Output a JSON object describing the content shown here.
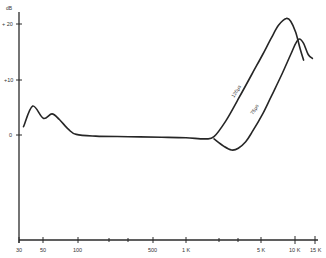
{
  "chart_data": {
    "type": "line",
    "title": "",
    "xlabel": "",
    "ylabel": "dB",
    "xscale": "log",
    "xlim": [
      30,
      15000
    ],
    "ylim": [
      -19,
      21
    ],
    "grid": false,
    "legend": "inline labels on curves",
    "x_ticks": [
      {
        "value": 30,
        "label": "30"
      },
      {
        "value": 50,
        "label": "50"
      },
      {
        "value": 100,
        "label": "100"
      },
      {
        "value": 200,
        "label": ""
      },
      {
        "value": 300,
        "label": ""
      },
      {
        "value": 500,
        "label": "500"
      },
      {
        "value": 1000,
        "label": "1 K"
      },
      {
        "value": 2000,
        "label": ""
      },
      {
        "value": 3000,
        "label": ""
      },
      {
        "value": 5000,
        "label": "5 K"
      },
      {
        "value": 10000,
        "label": "10 K"
      },
      {
        "value": 15000,
        "label": "15 K"
      }
    ],
    "y_ticks": [
      {
        "value": 20,
        "label": "+ 20"
      },
      {
        "value": 10,
        "label": "+10"
      },
      {
        "value": 0,
        "label": "0"
      }
    ],
    "series": [
      {
        "name": "120μs",
        "points": [
          [
            33,
            1.5
          ],
          [
            40,
            5.2
          ],
          [
            50,
            3.0
          ],
          [
            60,
            3.8
          ],
          [
            70,
            2.8
          ],
          [
            85,
            1.0
          ],
          [
            100,
            0.1
          ],
          [
            150,
            -0.2
          ],
          [
            300,
            -0.3
          ],
          [
            600,
            -0.4
          ],
          [
            1000,
            -0.5
          ],
          [
            1500,
            -0.7
          ],
          [
            1800,
            -0.3
          ],
          [
            2300,
            2.5
          ],
          [
            3000,
            6.5
          ],
          [
            4000,
            11.0
          ],
          [
            5000,
            14.5
          ],
          [
            6000,
            17.5
          ],
          [
            7000,
            19.8
          ],
          [
            8200,
            21.0
          ],
          [
            9000,
            20.5
          ],
          [
            10000,
            18.5
          ],
          [
            11000,
            15.5
          ],
          [
            11800,
            13.5
          ]
        ]
      },
      {
        "name": "75μs",
        "points": [
          [
            1800,
            -0.7
          ],
          [
            2200,
            -2.0
          ],
          [
            2600,
            -2.7
          ],
          [
            3000,
            -2.4
          ],
          [
            3500,
            -1.2
          ],
          [
            4000,
            0.5
          ],
          [
            5000,
            3.8
          ],
          [
            6000,
            7.0
          ],
          [
            7500,
            11.0
          ],
          [
            9000,
            14.5
          ],
          [
            10000,
            16.5
          ],
          [
            10800,
            17.3
          ],
          [
            11800,
            16.5
          ],
          [
            13000,
            14.5
          ],
          [
            14200,
            13.8
          ]
        ]
      }
    ]
  },
  "axes": {
    "y_unit": "dB",
    "y_labels": [
      "+ 20",
      "+10",
      "0"
    ],
    "x_labels": [
      "30",
      "50",
      "100",
      "500",
      "1 K",
      "5 K",
      "10 K",
      "15 K"
    ]
  },
  "curve_labels": {
    "a": "120μs",
    "b": "75μs"
  }
}
